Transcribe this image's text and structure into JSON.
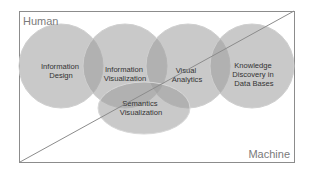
{
  "diagram": {
    "corner_labels": {
      "top_left": "Human",
      "bottom_right": "Machine"
    },
    "circles": [
      {
        "id": "information-design",
        "lines": [
          "Information",
          "Design"
        ]
      },
      {
        "id": "information-visualization",
        "lines": [
          "Information",
          "Visualization"
        ]
      },
      {
        "id": "visual-analytics",
        "lines": [
          "Visual",
          "Analytics"
        ]
      },
      {
        "id": "knowledge-discovery",
        "lines": [
          "Knowledge",
          "Discovery in",
          "Data Bases"
        ]
      }
    ],
    "ellipse": {
      "id": "semantics-visualization",
      "lines": [
        "Semantics",
        "Visualization"
      ]
    },
    "colors": {
      "fill": "#9c9c9c",
      "border": "#8a8a8a",
      "text": "#333333",
      "frame": "#8c8c8c"
    }
  }
}
